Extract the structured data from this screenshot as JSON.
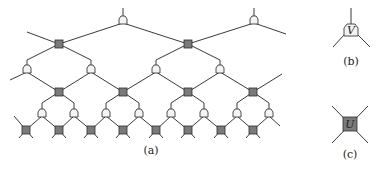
{
  "figure": {
    "captions": {
      "a": "(a)",
      "b": "(b)",
      "c": "(c)"
    },
    "legend": {
      "v_label": "V",
      "u_label": "U"
    },
    "colors": {
      "u_fill": "#7a7a7a",
      "v_fill": "#f4f4f4",
      "edge": "#3a3a3a"
    },
    "network": {
      "v_layers": [
        [
          [
            123,
            20
          ],
          [
            254,
            20
          ]
        ],
        [
          [
            27,
            69
          ],
          [
            91,
            69
          ],
          [
            156,
            69
          ],
          [
            220,
            69
          ]
        ],
        [
          [
            42,
            113
          ],
          [
            74,
            113
          ],
          [
            106,
            113
          ],
          [
            139,
            113
          ],
          [
            171,
            113
          ],
          [
            204,
            113
          ],
          [
            237,
            113
          ],
          [
            269,
            113
          ]
        ]
      ],
      "u_layers": [
        [
          [
            59,
            44
          ],
          [
            188,
            44
          ]
        ],
        [
          [
            59,
            92
          ],
          [
            123,
            92
          ],
          [
            188,
            92
          ],
          [
            253,
            92
          ]
        ],
        [
          [
            26,
            130
          ],
          [
            59,
            130
          ],
          [
            91,
            130
          ],
          [
            123,
            130
          ],
          [
            156,
            130
          ],
          [
            188,
            130
          ],
          [
            221,
            130
          ],
          [
            253,
            130
          ]
        ]
      ]
    }
  }
}
